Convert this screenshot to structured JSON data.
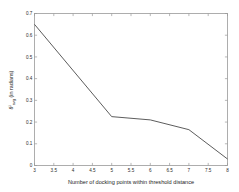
{
  "chart_data": {
    "type": "line",
    "title": "",
    "xlabel": "Number of docking points within threshold distance",
    "ylabel": "θⁱavg (in radians)",
    "ylabel_parts": {
      "symbol": "θ",
      "superscript": "i",
      "subscript": "avg",
      "rest": " (in radians)"
    },
    "x": [
      3,
      5,
      6,
      7,
      8
    ],
    "values": [
      0.65,
      0.225,
      0.21,
      0.165,
      0.03
    ],
    "series": [
      {
        "name": "theta_avg",
        "x": [
          3,
          5,
          6,
          7,
          8
        ],
        "values": [
          0.65,
          0.225,
          0.21,
          0.165,
          0.03
        ]
      }
    ],
    "xlim": [
      3,
      8
    ],
    "ylim": [
      0,
      0.7
    ],
    "xticks": [
      3,
      3.5,
      4,
      4.5,
      5,
      5.5,
      6,
      6.5,
      7,
      7.5,
      8
    ],
    "xtick_labels": [
      "3",
      "3.5",
      "4",
      "4.5",
      "5",
      "5.5",
      "6",
      "6.5",
      "7",
      "7.5",
      "8"
    ],
    "yticks": [
      0,
      0.1,
      0.2,
      0.3,
      0.4,
      0.5,
      0.6,
      0.7
    ],
    "ytick_labels": [
      "0",
      "0.1",
      "0.2",
      "0.3",
      "0.4",
      "0.5",
      "0.6",
      "0.7"
    ],
    "grid": false,
    "legend": null,
    "line_color": "#4a4a4a",
    "axis_color": "#9a9a9a",
    "background": "#ffffff"
  }
}
